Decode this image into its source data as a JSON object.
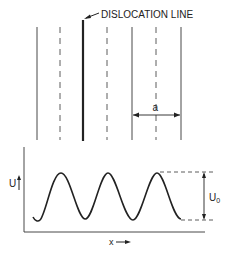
{
  "figure": {
    "top_panel": {
      "label_dislocation": "DISLOCATION LINE",
      "label_spacing": "a",
      "solid_lines_x": [
        37,
        132,
        181
      ],
      "dashed_lines_x": [
        60,
        107,
        156
      ],
      "dislocation_line_x": 83
    },
    "bottom_panel": {
      "y_axis_label": "U",
      "x_axis_label": "x",
      "amplitude_label": "U",
      "amplitude_subscript": "0",
      "curve": "periodic potential, 3 peaks",
      "peaks_x": [
        61,
        108,
        157
      ],
      "troughs_x": [
        38,
        85,
        133,
        180
      ]
    },
    "colors": {
      "ink": "#222222",
      "background": "#ffffff"
    }
  }
}
